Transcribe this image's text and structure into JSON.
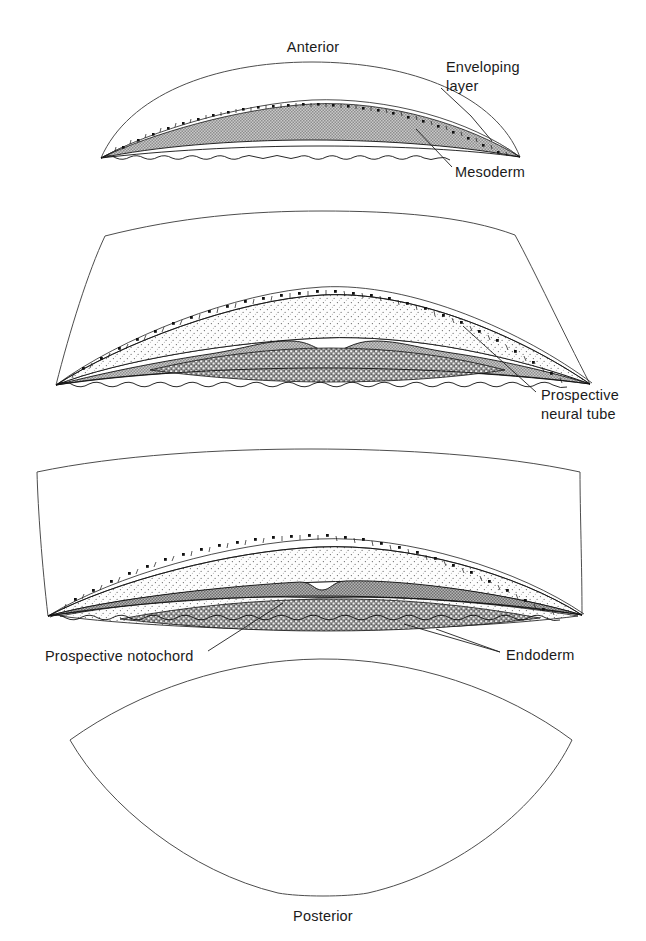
{
  "figure": {
    "kind": "biological-diagram",
    "orientation_labels": {
      "anterior": "Anterior",
      "posterior": "Posterior"
    },
    "panel_count": 4,
    "colors": {
      "outline_stroke": "#4d4d4d",
      "ink_stroke": "#111111",
      "mesoderm_fill": "#a8a8a8",
      "neural_stipple_fill": "#f7f7f7",
      "endoderm_stipple_fill": "#9a9a9a",
      "enveloping_layer_fill": "#ffffff",
      "background": "#ffffff",
      "label_text": "#1b1b1b"
    },
    "labels": [
      {
        "id": "enveloping-layer",
        "text_lines": [
          "Enveloping",
          "layer"
        ],
        "panel": 1
      },
      {
        "id": "mesoderm",
        "text_lines": [
          "Mesoderm"
        ],
        "panel": 1
      },
      {
        "id": "prospective-neural-tube",
        "text_lines": [
          "Prospective",
          "neural tube"
        ],
        "panel": 2
      },
      {
        "id": "prospective-notochord",
        "text_lines": [
          "Prospective notochord"
        ],
        "panel": 3
      },
      {
        "id": "endoderm",
        "text_lines": [
          "Endoderm"
        ],
        "panel": 3
      }
    ],
    "panels": [
      {
        "index": 1,
        "name": "panel-anterior",
        "tissues": [
          "enveloping layer",
          "mesoderm"
        ],
        "notes": "Thin lens-shaped section; cellular enveloping layer over a solid stippled mesoderm mass; wavy basal margin"
      },
      {
        "index": 2,
        "name": "panel-upper-middle",
        "tissues": [
          "enveloping layer",
          "prospective neural tube",
          "mesoderm",
          "endoderm"
        ],
        "notes": "Broader section; pale stippled prospective neural tube beneath the enveloping layer, grey mesoderm with internal dense stippled endoderm lens"
      },
      {
        "index": 3,
        "name": "panel-lower-middle",
        "tissues": [
          "enveloping layer",
          "prospective neural tube",
          "prospective notochord",
          "mesoderm",
          "endoderm"
        ],
        "notes": "Mesoderm thins to a dark band that dips centrally at the prospective notochord; dense endoderm band along the base"
      },
      {
        "index": 4,
        "name": "panel-posterior",
        "tissues": [],
        "notes": "Empty lens-shaped outline, no internal germ layers drawn"
      }
    ]
  }
}
